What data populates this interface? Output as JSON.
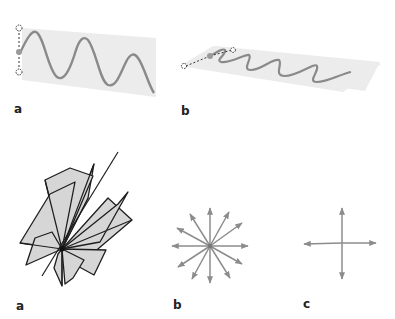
{
  "figure": {
    "top_row": {
      "panels": [
        {
          "id": "a",
          "label": "a",
          "description": "Vertically polarized wave oscillating within a vertical plane"
        },
        {
          "id": "b",
          "label": "b",
          "description": "Wave oscillating within a horizontal plane seen in perspective"
        }
      ]
    },
    "bottom_row": {
      "panels": [
        {
          "id": "a",
          "label": "a",
          "description": "Many planes of vibration intersecting along a common axis (unpolarized light)"
        },
        {
          "id": "b",
          "label": "b",
          "description": "Vibration vectors in all directions from a center point"
        },
        {
          "id": "c",
          "label": "c",
          "description": "Resolved into two perpendicular components"
        }
      ]
    }
  },
  "colors": {
    "background": "#ffffff",
    "plane_fill": "#ececec",
    "wave_stroke": "#8a8a8a",
    "arrow_stroke": "#8c8c8c",
    "sheet_fill": "#d6d6d6",
    "sheet_stroke": "#1e1e1e",
    "label": "#222222",
    "dashed_marker": "#333333",
    "dot_fill": "#9a9a9a"
  }
}
